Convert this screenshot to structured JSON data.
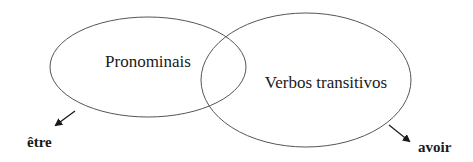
{
  "diagram": {
    "type": "venn",
    "sets": [
      {
        "id": "pronominais",
        "label": "Pronominais",
        "cx": 148,
        "cy": 67,
        "rx": 98,
        "ry": 50
      },
      {
        "id": "verbos-transitivos",
        "label": "Verbos transitivos",
        "cx": 306,
        "cy": 80,
        "rx": 105,
        "ry": 67
      }
    ],
    "auxiliaries": [
      {
        "id": "etre",
        "label": "être",
        "points_from": "pronominais",
        "arrow": {
          "x1": 75,
          "y1": 111,
          "x2": 56,
          "y2": 125
        },
        "text_x": 27,
        "text_y": 147
      },
      {
        "id": "avoir",
        "label": "avoir",
        "points_from": "verbos-transitivos",
        "arrow": {
          "x1": 389,
          "y1": 125,
          "x2": 409,
          "y2": 141
        },
        "text_x": 418,
        "text_y": 152
      }
    ],
    "colors": {
      "stroke": "#555555",
      "text": "#1a1a1a",
      "arrow": "#1a1a1a",
      "background": "#ffffff"
    }
  }
}
